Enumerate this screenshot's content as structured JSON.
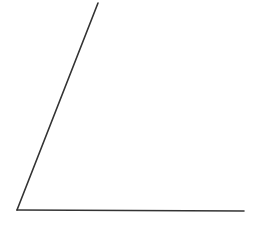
{
  "diagram": {
    "type": "angle",
    "background": "#ffffff",
    "stroke_color": "#333333",
    "stroke_width": 1.6,
    "vertex": {
      "x": 17,
      "y": 210
    },
    "rays": [
      {
        "name": "slanted-ray",
        "from": {
          "x": 17,
          "y": 210
        },
        "to": {
          "x": 98,
          "y": 3
        }
      },
      {
        "name": "horizontal-ray",
        "from": {
          "x": 17,
          "y": 210
        },
        "to": {
          "x": 244,
          "y": 211
        }
      }
    ],
    "labels": []
  }
}
